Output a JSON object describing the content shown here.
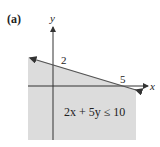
{
  "figure": {
    "label": "(a)",
    "x_axis_label": "x",
    "y_axis_label": "y",
    "y_intercept_label": "2",
    "x_intercept_label": "5",
    "inequality": "2x + 5y ≤ 10",
    "colors": {
      "shade": "#dcdcdc",
      "line": "#555555",
      "axis": "#333333"
    }
  }
}
